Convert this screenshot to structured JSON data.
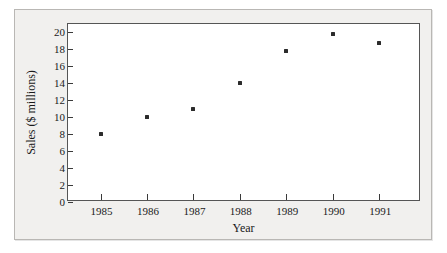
{
  "chart_data": {
    "type": "scatter",
    "title": "",
    "xlabel": "Year",
    "ylabel": "Sales ($ millions)",
    "x": [
      1985,
      1986,
      1987,
      1988,
      1989,
      1990,
      1991
    ],
    "categories": [
      "1985",
      "1986",
      "1987",
      "1988",
      "1989",
      "1990",
      "1991"
    ],
    "values": [
      8,
      10,
      11,
      14,
      17.8,
      19.8,
      18.8
    ],
    "series": [
      {
        "name": "Sales",
        "values": [
          8,
          10,
          11,
          14,
          17.8,
          19.8,
          18.8
        ]
      }
    ],
    "xlim": [
      1984.3,
      1991.9
    ],
    "ylim": [
      0,
      21
    ],
    "yticks": [
      0,
      2,
      4,
      6,
      8,
      10,
      12,
      14,
      16,
      18,
      20
    ],
    "ytick_labels": [
      "0",
      "2",
      "4",
      "6",
      "8",
      "10",
      "12",
      "14",
      "16",
      "18",
      "20"
    ],
    "xticks": [
      1985,
      1986,
      1987,
      1988,
      1989,
      1990,
      1991
    ],
    "xtick_labels": [
      "1985",
      "1986",
      "1987",
      "1988",
      "1989",
      "1990",
      "1991"
    ],
    "grid": false,
    "legend": false,
    "marker_color": "#2b2b2b",
    "plot_background": "#ffffff",
    "figure_background": "#f1f0ee",
    "axis_color": "#555555"
  }
}
